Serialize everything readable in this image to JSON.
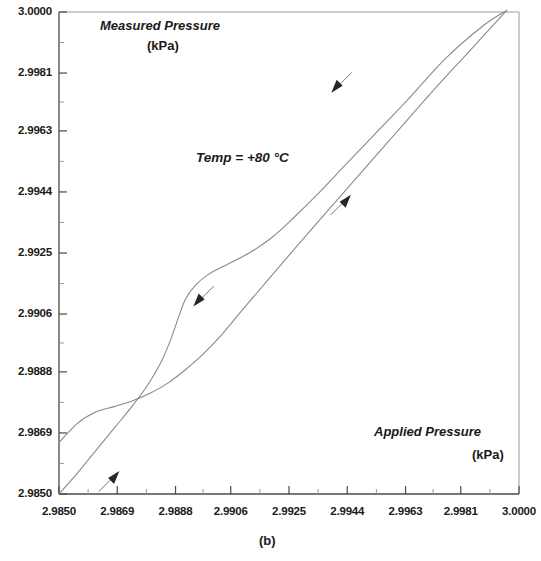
{
  "figure": {
    "caption": "(b)",
    "annotation": "Temp = +80 °C",
    "background": "#ffffff",
    "line_color": "#8a8a8a",
    "axis_color": "#4a4a4a",
    "text_color": "#1a1a1a"
  },
  "chart_data": {
    "type": "line",
    "title": "",
    "subtitle": "",
    "xlabel": "Applied Pressure",
    "xunit": "(kPa)",
    "ylabel": "Measured Pressure",
    "yunit": "(kPa)",
    "xlim": [
      2.985,
      3.0
    ],
    "ylim": [
      2.985,
      3.0
    ],
    "grid": false,
    "legend": null,
    "xticks": [
      "2.9850",
      "2.9869",
      "2.9888",
      "2.9906",
      "2.9925",
      "2.9944",
      "2.9963",
      "2.9981",
      "3.0000"
    ],
    "yticks": [
      "3.0000",
      "2.9981",
      "2.9963",
      "2.9944",
      "2.9925",
      "2.9906",
      "2.9888",
      "2.9869",
      "2.9850"
    ],
    "xtick_values": [
      2.985,
      2.9869,
      2.9888,
      2.9906,
      2.9925,
      2.9944,
      2.9963,
      2.9981,
      3.0
    ],
    "ytick_values": [
      3.0,
      2.9981,
      2.9963,
      2.9944,
      2.9925,
      2.9906,
      2.9888,
      2.9869,
      2.985
    ],
    "minor_ticks_per_interval": 1,
    "annotations": [
      {
        "text": "Temp = +80 °C",
        "x": 2.991,
        "y": 2.996
      }
    ],
    "series": [
      {
        "name": "increasing-pressure-branch",
        "direction": "up",
        "points": [
          [
            2.985,
            2.985
          ],
          [
            2.9856,
            2.98565
          ],
          [
            2.9862,
            2.98635
          ],
          [
            2.9868,
            2.98705
          ],
          [
            2.9874,
            2.98775
          ],
          [
            2.9879,
            2.9884
          ],
          [
            2.9883,
            2.98905
          ],
          [
            2.98862,
            2.98975
          ],
          [
            2.98888,
            2.99045
          ],
          [
            2.98912,
            2.99105
          ],
          [
            2.98945,
            2.9915
          ],
          [
            2.9899,
            2.99185
          ],
          [
            2.9905,
            2.99215
          ],
          [
            2.9912,
            2.9925
          ],
          [
            2.9919,
            2.99295
          ],
          [
            2.9926,
            2.99355
          ],
          [
            2.9934,
            2.9943
          ],
          [
            2.9943,
            2.9952
          ],
          [
            2.9953,
            2.9962
          ],
          [
            2.9964,
            2.9973
          ],
          [
            2.9976,
            2.99855
          ],
          [
            2.9988,
            2.99955
          ],
          [
            2.9996,
            3.00005
          ]
        ]
      },
      {
        "name": "decreasing-pressure-branch",
        "direction": "down",
        "points": [
          [
            2.9996,
            3.00005
          ],
          [
            2.9984,
            2.9988
          ],
          [
            2.9972,
            2.99755
          ],
          [
            2.996,
            2.99625
          ],
          [
            2.9948,
            2.99495
          ],
          [
            2.9937,
            2.99375
          ],
          [
            2.9927,
            2.99265
          ],
          [
            2.9918,
            2.99165
          ],
          [
            2.991,
            2.99075
          ],
          [
            2.9903,
            2.98995
          ],
          [
            2.9897,
            2.98935
          ],
          [
            2.9891,
            2.98885
          ],
          [
            2.98855,
            2.98845
          ],
          [
            2.988,
            2.98815
          ],
          [
            2.9874,
            2.9879
          ],
          [
            2.9868,
            2.98772
          ],
          [
            2.9862,
            2.98755
          ],
          [
            2.9856,
            2.9872
          ],
          [
            2.985,
            2.9866
          ]
        ]
      }
    ],
    "direction_arrows": [
      {
        "name": "arrow-upper-unloading",
        "x": 2.99395,
        "y": 2.99755,
        "direction": "down-left"
      },
      {
        "name": "arrow-middle-loading",
        "x": 2.99445,
        "y": 2.99425,
        "direction": "up-right"
      },
      {
        "name": "arrow-middle-unloading",
        "x": 2.98945,
        "y": 2.9909,
        "direction": "down-left"
      },
      {
        "name": "arrow-lower-loading",
        "x": 2.9869,
        "y": 2.98565,
        "direction": "up-right"
      }
    ]
  }
}
